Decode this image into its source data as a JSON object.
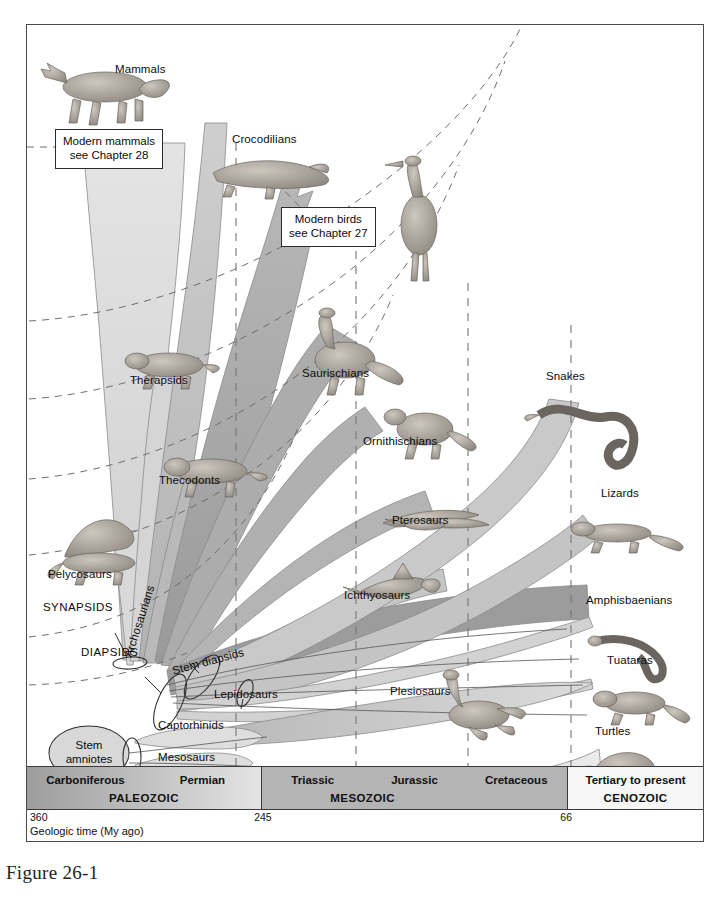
{
  "figure": {
    "caption": "Figure 26-1"
  },
  "callouts": [
    {
      "id": "modern-mammals",
      "line1": "Modern mammals",
      "line2": "see Chapter 28"
    },
    {
      "id": "modern-birds",
      "line1": "Modern birds",
      "line2": "see Chapter 27"
    }
  ],
  "taxa": [
    {
      "name": "Mammals",
      "x": 88,
      "y": 38,
      "rot": 0
    },
    {
      "name": "Crocodilians",
      "x": 231,
      "y": 108,
      "rot": 0
    },
    {
      "name": "Birds",
      "x": 333,
      "y": 185,
      "rot": 0
    },
    {
      "name": "Therapsids",
      "x": 129,
      "y": 374,
      "rot": 0
    },
    {
      "name": "Saurischians",
      "x": 300,
      "y": 367,
      "rot": 0
    },
    {
      "name": "Ornithischians",
      "x": 362,
      "y": 435,
      "rot": 0
    },
    {
      "name": "Thecodonts",
      "x": 158,
      "y": 474,
      "rot": 0
    },
    {
      "name": "Pterosaurs",
      "x": 391,
      "y": 514,
      "rot": 0
    },
    {
      "name": "Snakes",
      "x": 545,
      "y": 370,
      "rot": 0
    },
    {
      "name": "Lizards",
      "x": 600,
      "y": 487,
      "rot": 0
    },
    {
      "name": "Ichthyosaurs",
      "x": 343,
      "y": 589,
      "rot": 0
    },
    {
      "name": "Pelycosaurs",
      "x": 47,
      "y": 568,
      "rot": 0
    },
    {
      "name": "Amphisbaenians",
      "x": 585,
      "y": 594,
      "rot": 0
    },
    {
      "name": "Tuataras",
      "x": 606,
      "y": 654,
      "rot": 0
    },
    {
      "name": "Plesiosaurs",
      "x": 389,
      "y": 685,
      "rot": 0
    },
    {
      "name": "Turtles",
      "x": 594,
      "y": 725,
      "rot": 0
    },
    {
      "name": "Archosaurians",
      "x": 121,
      "y": 628,
      "rot": -72
    },
    {
      "name": "Stem diapsids",
      "x": 170,
      "y": 657,
      "rot": -15
    },
    {
      "name": "Lepidosaurs",
      "x": 213,
      "y": 688,
      "rot": 0
    },
    {
      "name": "Captorhinids",
      "x": 157,
      "y": 719,
      "rot": 0
    },
    {
      "name": "Mesosaurs",
      "x": 157,
      "y": 751,
      "rot": 0
    }
  ],
  "clades": [
    {
      "name": "SYNAPSIDS",
      "x": 42,
      "y": 600
    },
    {
      "name": "DIAPSIDS",
      "x": 80,
      "y": 645
    },
    {
      "name": "ANAPSIDS",
      "x": 120,
      "y": 772
    }
  ],
  "root_node": {
    "line1": "Stem",
    "line2": "amniotes",
    "x": 36,
    "y": 720
  },
  "timeline": {
    "eras": [
      {
        "era": "PALEOZOIC",
        "periods": [
          "Carboniferous",
          "Permian"
        ],
        "width_pct": 34.6,
        "fill_start": "#9d9d9d",
        "fill_end": "#e2e2e2"
      },
      {
        "era": "MESOZOIC",
        "periods": [
          "Triassic",
          "Jurassic",
          "Cretaceous"
        ],
        "width_pct": 45.3,
        "fill_start": "#b4b4b4",
        "fill_end": "#b4b4b4"
      },
      {
        "era": "CENOZOIC",
        "periods": [
          "Tertiary to present"
        ],
        "width_pct": 20.1,
        "fill_start": "#f5f5f5",
        "fill_end": "#f5f5f5"
      }
    ],
    "ticks": [
      {
        "value": "360",
        "left_pct": 0.4
      },
      {
        "value": "245",
        "left_pct": 33.6
      },
      {
        "value": "66",
        "left_pct": 78.9
      }
    ],
    "axis_label": "Geologic time (My ago)"
  },
  "colors": {
    "frame_border": "#4a4a4a",
    "wedge_light": "#dcdcdc",
    "wedge_mid": "#c2c2c2",
    "wedge_dark": "#a6a6a6",
    "wedge_darker": "#8f8f8f",
    "dashed_line": "#6b6b6b",
    "text": "#0c0c0c"
  }
}
